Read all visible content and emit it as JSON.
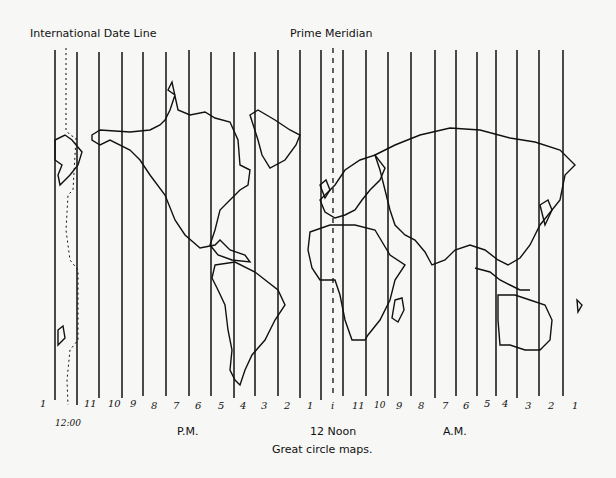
{
  "header": {
    "date_line_label": "International Date Line",
    "prime_meridian_label": "Prime Meridian"
  },
  "hours": {
    "left_edge": "1",
    "date_line_time": "12:00",
    "pm": [
      "11",
      "10",
      "9",
      "8",
      "7",
      "6",
      "5",
      "4",
      "3",
      "2",
      "1"
    ],
    "noon_tick": "i",
    "am": [
      "11",
      "10",
      "9",
      "8",
      "7",
      "6",
      "5",
      "4",
      "3",
      "2",
      "1"
    ]
  },
  "footer": {
    "pm_label": "P.M.",
    "noon_label": "12 Noon",
    "am_label": "A.M.",
    "caption": "Great circle maps."
  },
  "colors": {
    "ink": "#111111",
    "paper": "#f7f7f5"
  }
}
